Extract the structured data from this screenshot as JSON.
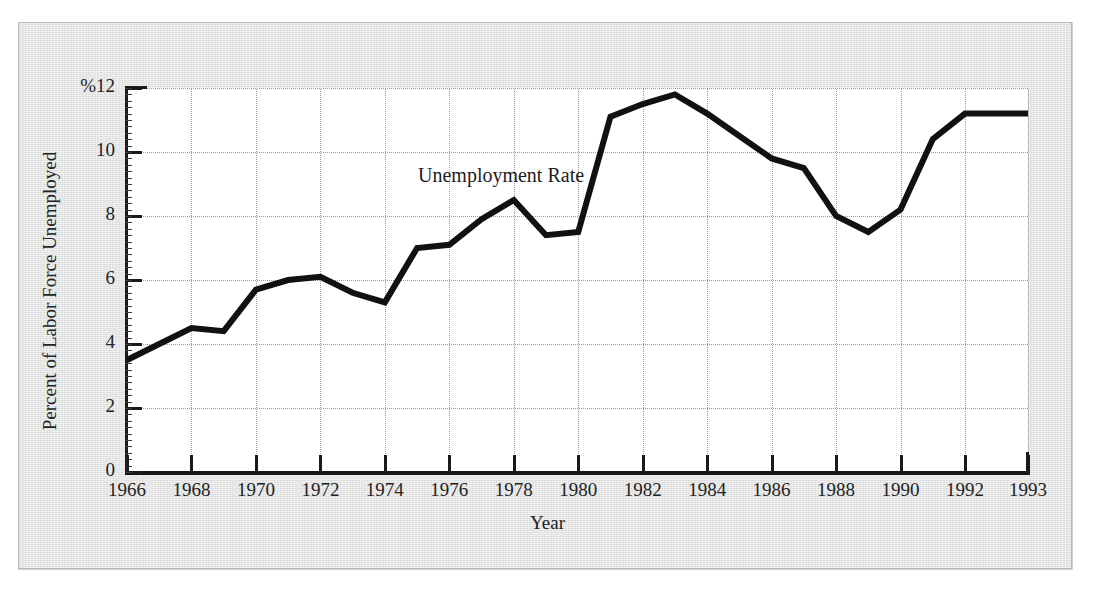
{
  "chart_data": {
    "type": "line",
    "title": "",
    "annotation": "Unemployment Rate",
    "xlabel": "Year",
    "ylabel": "Percent of Labor Force Unemployed",
    "y_unit_prefix": "%",
    "ylim": [
      0,
      12
    ],
    "xlim": [
      1966,
      1993
    ],
    "grid": "both-dotted",
    "legend": "none",
    "y_ticks": [
      0,
      2,
      4,
      6,
      8,
      10,
      12
    ],
    "y_tick_labels": [
      "0",
      "2",
      "4",
      "6",
      "8",
      "10",
      "%12"
    ],
    "x_ticks": [
      1966,
      1968,
      1970,
      1972,
      1974,
      1976,
      1978,
      1980,
      1982,
      1984,
      1986,
      1988,
      1990,
      1992,
      1993
    ],
    "x_tick_labels": [
      "1966",
      "1968",
      "1970",
      "1972",
      "1974",
      "1976",
      "1978",
      "1980",
      "1982",
      "1984",
      "1986",
      "1988",
      "1990",
      "1992",
      "1993"
    ],
    "series": [
      {
        "name": "Unemployment Rate",
        "color": "#111111",
        "x": [
          1966,
          1967,
          1968,
          1969,
          1970,
          1971,
          1972,
          1973,
          1974,
          1975,
          1976,
          1977,
          1978,
          1979,
          1980,
          1981,
          1982,
          1983,
          1984,
          1985,
          1986,
          1987,
          1988,
          1989,
          1990,
          1991,
          1992,
          1993
        ],
        "values": [
          3.5,
          4.0,
          4.5,
          4.4,
          5.7,
          6.0,
          6.1,
          5.6,
          5.3,
          7.0,
          7.1,
          7.9,
          8.5,
          7.4,
          7.5,
          11.1,
          11.5,
          11.8,
          11.2,
          10.5,
          9.8,
          9.5,
          8.0,
          7.5,
          8.2,
          10.4,
          11.2,
          11.2
        ]
      }
    ]
  },
  "axis": {
    "y_title": "Percent of Labor Force Unemployed",
    "x_title": "Year"
  },
  "annotation": {
    "series_label": "Unemployment Rate"
  },
  "y_labels": {
    "t0": "0",
    "t2": "2",
    "t4": "4",
    "t6": "6",
    "t8": "8",
    "t10": "10",
    "t12": "%12"
  },
  "x_labels": {
    "t1966": "1966",
    "t1968": "1968",
    "t1970": "1970",
    "t1972": "1972",
    "t1974": "1974",
    "t1976": "1976",
    "t1978": "1978",
    "t1980": "1980",
    "t1982": "1982",
    "t1984": "1984",
    "t1986": "1986",
    "t1988": "1988",
    "t1990": "1990",
    "t1992": "1992",
    "t1993": "1993"
  },
  "colors": {
    "line": "#111111",
    "axis": "#1a1a1a",
    "grid": "#9c9c9c",
    "page": "#e3e3e3",
    "plot_background": "#ffffff",
    "text": "#232323"
  }
}
